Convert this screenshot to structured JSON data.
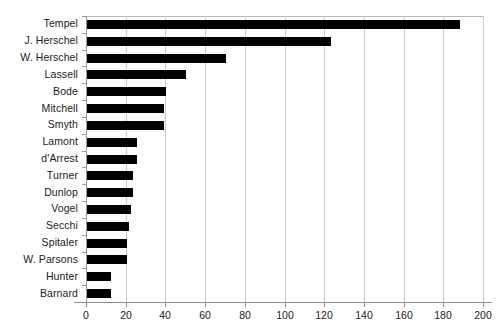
{
  "chart_data": {
    "type": "bar",
    "orientation": "horizontal",
    "title": "",
    "subtitle": "",
    "xlabel": "",
    "ylabel": "",
    "xlim": [
      0,
      200
    ],
    "xticks": [
      0,
      20,
      40,
      60,
      80,
      100,
      120,
      140,
      160,
      180,
      200
    ],
    "grid": "vertical",
    "legend": "none",
    "bar_color": "#000000",
    "grid_color": "#c9c9c9",
    "axis_color": "#8d8d8d",
    "categories": [
      "Tempel",
      "J. Herschel",
      "W. Herschel",
      "Lassell",
      "Bode",
      "Mitchell",
      "Smyth",
      "Lamont",
      "d'Arrest",
      "Turner",
      "Dunlop",
      "Vogel",
      "Secchi",
      "Spitaler",
      "W. Parsons",
      "Hunter",
      "Barnard"
    ],
    "values": [
      188,
      123,
      70,
      50,
      40,
      39,
      39,
      25,
      25,
      23,
      23,
      22,
      21,
      20,
      20,
      12,
      12
    ]
  }
}
